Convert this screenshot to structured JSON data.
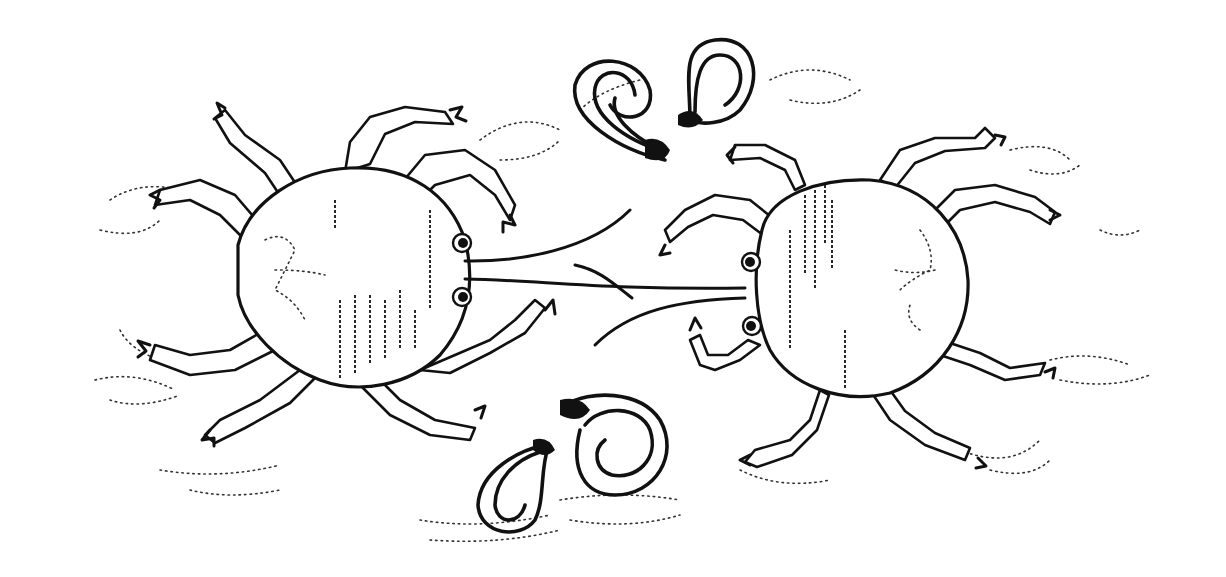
{
  "illustration": {
    "description": "Line drawing of two crabs facing each other, connected by long lines, with coiled shapes above and below between them on a speckled sand background",
    "colors": {
      "background": "#ffffff",
      "ink": "#111111"
    },
    "elements": {
      "left_crab": "crab-left",
      "right_crab": "crab-right",
      "top_coils": "coil-pair-top",
      "bottom_coils": "coil-pair-bottom",
      "center_lines": "connecting-lines",
      "ground": "sand-speckles"
    }
  }
}
